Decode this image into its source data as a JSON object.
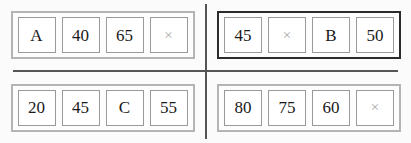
{
  "board": {
    "layout": "2x2-grid",
    "divider_color": "#555555",
    "background_color": "#fbfbfb",
    "group_border_color": "#b4b4b4",
    "group_border_color_highlighted": "#2b2b2b",
    "tile_border_color": "#9a9a9a",
    "tile_text_color": "#1a1a1a",
    "blank_glyph_color": "#a9a9a9",
    "blank_glyph": "×",
    "groups": [
      {
        "position": "top-left",
        "highlighted": false,
        "tiles": [
          {
            "value": "A",
            "blank": false
          },
          {
            "value": "40",
            "blank": false
          },
          {
            "value": "65",
            "blank": false
          },
          {
            "value": "×",
            "blank": true
          }
        ]
      },
      {
        "position": "top-right",
        "highlighted": true,
        "tiles": [
          {
            "value": "45",
            "blank": false
          },
          {
            "value": "×",
            "blank": true
          },
          {
            "value": "B",
            "blank": false
          },
          {
            "value": "50",
            "blank": false
          }
        ]
      },
      {
        "position": "bottom-left",
        "highlighted": false,
        "tiles": [
          {
            "value": "20",
            "blank": false
          },
          {
            "value": "45",
            "blank": false
          },
          {
            "value": "C",
            "blank": false
          },
          {
            "value": "55",
            "blank": false
          }
        ]
      },
      {
        "position": "bottom-right",
        "highlighted": false,
        "tiles": [
          {
            "value": "80",
            "blank": false
          },
          {
            "value": "75",
            "blank": false
          },
          {
            "value": "60",
            "blank": false
          },
          {
            "value": "×",
            "blank": true
          }
        ]
      }
    ]
  }
}
